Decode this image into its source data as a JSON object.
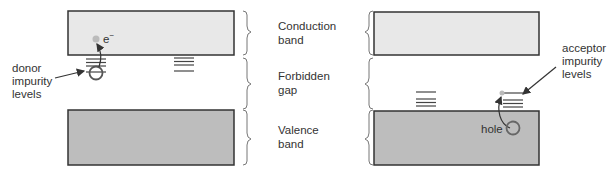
{
  "diagram": {
    "type": "semiconductor-energy-band-diagram",
    "colors": {
      "conduction_band_fill": "#e8e8e8",
      "valence_band_fill": "#bdbdbd",
      "outline": "#333333",
      "carrier_fill": "#bbbbbb",
      "brace": "#777777"
    },
    "center_labels": {
      "conduction": {
        "line1": "Conduction",
        "line2": "band"
      },
      "forbidden": {
        "line1": "Forbidden",
        "line2": "gap"
      },
      "valence": {
        "line1": "Valence",
        "line2": "band"
      }
    },
    "left_panel": {
      "name": "n-type (donor)",
      "electron_label": "e",
      "electron_superscript": "−",
      "callout": {
        "line1": "donor",
        "line2": "impurity",
        "line3": "levels"
      }
    },
    "right_panel": {
      "name": "p-type (acceptor)",
      "hole_label": "hole",
      "callout": {
        "line1": "acceptor",
        "line2": "impurity",
        "line3": "levels"
      }
    }
  }
}
